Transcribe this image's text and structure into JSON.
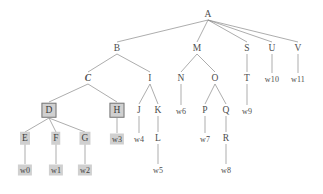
{
  "figure": {
    "kind": "syntax-tree-diagram",
    "width": 323,
    "height": 194,
    "background": "#ffffff",
    "edge_color": "#8a8a8a",
    "text_color": "#4d4d4d",
    "highlight_color": "#d0d0d0",
    "box_border_color": "#7a7a7a"
  },
  "nodes": [
    {
      "id": "A",
      "label": "A",
      "x": 208,
      "y": 14,
      "style": "plain",
      "kind": "nonterminal"
    },
    {
      "id": "B",
      "label": "B",
      "x": 117,
      "y": 48,
      "style": "plain",
      "kind": "nonterminal"
    },
    {
      "id": "M",
      "label": "M",
      "x": 197,
      "y": 48,
      "style": "plain",
      "kind": "nonterminal"
    },
    {
      "id": "S",
      "label": "S",
      "x": 247,
      "y": 48,
      "style": "plain",
      "kind": "nonterminal"
    },
    {
      "id": "U",
      "label": "U",
      "x": 272,
      "y": 48,
      "style": "plain",
      "kind": "nonterminal"
    },
    {
      "id": "V",
      "label": "V",
      "x": 298,
      "y": 48,
      "style": "plain",
      "kind": "nonterminal"
    },
    {
      "id": "C",
      "label": "C",
      "x": 88,
      "y": 78,
      "style": "emph",
      "kind": "nonterminal"
    },
    {
      "id": "I",
      "label": "I",
      "x": 150,
      "y": 78,
      "style": "plain",
      "kind": "nonterminal"
    },
    {
      "id": "N",
      "label": "N",
      "x": 181,
      "y": 78,
      "style": "plain",
      "kind": "nonterminal"
    },
    {
      "id": "O",
      "label": "O",
      "x": 215,
      "y": 78,
      "style": "plain",
      "kind": "nonterminal"
    },
    {
      "id": "T",
      "label": "T",
      "x": 247,
      "y": 78,
      "style": "plain",
      "kind": "nonterminal"
    },
    {
      "id": "w10",
      "label": "w10",
      "x": 272,
      "y": 79,
      "style": "plain",
      "kind": "terminal"
    },
    {
      "id": "w11",
      "label": "w11",
      "x": 298,
      "y": 79,
      "style": "plain",
      "kind": "terminal"
    },
    {
      "id": "D",
      "label": "D",
      "x": 49,
      "y": 110,
      "style": "boxed",
      "kind": "nonterminal"
    },
    {
      "id": "H",
      "label": "H",
      "x": 117,
      "y": 110,
      "style": "boxed",
      "kind": "nonterminal"
    },
    {
      "id": "J",
      "label": "J",
      "x": 139,
      "y": 110,
      "style": "plain",
      "kind": "nonterminal"
    },
    {
      "id": "K",
      "label": "K",
      "x": 158,
      "y": 110,
      "style": "plain",
      "kind": "nonterminal"
    },
    {
      "id": "w6",
      "label": "w6",
      "x": 181,
      "y": 111,
      "style": "plain",
      "kind": "terminal"
    },
    {
      "id": "P",
      "label": "P",
      "x": 205,
      "y": 110,
      "style": "plain",
      "kind": "nonterminal"
    },
    {
      "id": "Q",
      "label": "Q",
      "x": 226,
      "y": 110,
      "style": "plain",
      "kind": "nonterminal"
    },
    {
      "id": "w9",
      "label": "w9",
      "x": 247,
      "y": 111,
      "style": "plain",
      "kind": "terminal"
    },
    {
      "id": "E",
      "label": "E",
      "x": 25,
      "y": 138,
      "style": "hl",
      "kind": "nonterminal"
    },
    {
      "id": "F",
      "label": "F",
      "x": 56,
      "y": 138,
      "style": "hl",
      "kind": "nonterminal"
    },
    {
      "id": "G",
      "label": "G",
      "x": 85,
      "y": 138,
      "style": "hl",
      "kind": "nonterminal"
    },
    {
      "id": "w3",
      "label": "w3",
      "x": 117,
      "y": 139,
      "style": "hl",
      "kind": "terminal"
    },
    {
      "id": "w4",
      "label": "w4",
      "x": 139,
      "y": 139,
      "style": "plain",
      "kind": "terminal"
    },
    {
      "id": "L",
      "label": "L",
      "x": 158,
      "y": 138,
      "style": "plain",
      "kind": "nonterminal"
    },
    {
      "id": "w7",
      "label": "w7",
      "x": 205,
      "y": 139,
      "style": "plain",
      "kind": "terminal"
    },
    {
      "id": "R",
      "label": "R",
      "x": 226,
      "y": 138,
      "style": "plain",
      "kind": "nonterminal"
    },
    {
      "id": "w0",
      "label": "w0",
      "x": 25,
      "y": 170,
      "style": "hl",
      "kind": "terminal"
    },
    {
      "id": "w1",
      "label": "w1",
      "x": 56,
      "y": 170,
      "style": "hl",
      "kind": "terminal"
    },
    {
      "id": "w2",
      "label": "w2",
      "x": 85,
      "y": 170,
      "style": "hl",
      "kind": "terminal"
    },
    {
      "id": "w5",
      "label": "w5",
      "x": 158,
      "y": 170,
      "style": "plain",
      "kind": "terminal"
    },
    {
      "id": "w8",
      "label": "w8",
      "x": 226,
      "y": 170,
      "style": "plain",
      "kind": "terminal"
    }
  ],
  "edges": [
    {
      "from": "A",
      "to": "B"
    },
    {
      "from": "A",
      "to": "M"
    },
    {
      "from": "A",
      "to": "S"
    },
    {
      "from": "A",
      "to": "U"
    },
    {
      "from": "A",
      "to": "V"
    },
    {
      "from": "B",
      "to": "C"
    },
    {
      "from": "B",
      "to": "I"
    },
    {
      "from": "C",
      "to": "D"
    },
    {
      "from": "C",
      "to": "H"
    },
    {
      "from": "D",
      "to": "E"
    },
    {
      "from": "D",
      "to": "F"
    },
    {
      "from": "D",
      "to": "G"
    },
    {
      "from": "E",
      "to": "w0"
    },
    {
      "from": "F",
      "to": "w1"
    },
    {
      "from": "G",
      "to": "w2"
    },
    {
      "from": "H",
      "to": "w3"
    },
    {
      "from": "I",
      "to": "J"
    },
    {
      "from": "I",
      "to": "K"
    },
    {
      "from": "J",
      "to": "w4"
    },
    {
      "from": "K",
      "to": "L"
    },
    {
      "from": "L",
      "to": "w5"
    },
    {
      "from": "M",
      "to": "N"
    },
    {
      "from": "M",
      "to": "O"
    },
    {
      "from": "N",
      "to": "w6"
    },
    {
      "from": "O",
      "to": "P"
    },
    {
      "from": "O",
      "to": "Q"
    },
    {
      "from": "P",
      "to": "w7"
    },
    {
      "from": "Q",
      "to": "R"
    },
    {
      "from": "R",
      "to": "w8"
    },
    {
      "from": "S",
      "to": "T"
    },
    {
      "from": "T",
      "to": "w9"
    },
    {
      "from": "U",
      "to": "w10"
    },
    {
      "from": "V",
      "to": "w11"
    }
  ]
}
